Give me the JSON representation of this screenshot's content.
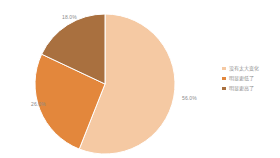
{
  "chart_data": {
    "type": "pie",
    "title": "",
    "subtitle": "",
    "xlabel": "",
    "ylabel": "",
    "grid": false,
    "legend_position": "right",
    "start_angle_deg": 0,
    "direction": "clockwise",
    "categories": [
      "没有太大变化",
      "明显更低了",
      "明显更高了"
    ],
    "values": [
      56.0,
      26.0,
      18.0
    ],
    "labels": [
      "56.0%",
      "26.0%",
      "18.0%"
    ],
    "colors": [
      "#F5C9A3",
      "#E3873C",
      "#A9703F"
    ],
    "slices": [
      {
        "name": "没有太大变化",
        "value": 56.0,
        "label": "56.0%",
        "color": "#F5C9A3"
      },
      {
        "name": "明显更低了",
        "value": 26.0,
        "label": "26.0%",
        "color": "#E3873C"
      },
      {
        "name": "明显更高了",
        "value": 18.0,
        "label": "18.0%",
        "color": "#A9703F"
      }
    ]
  },
  "legend": {
    "items": [
      {
        "label": "没有太大变化",
        "color": "#F5C9A3"
      },
      {
        "label": "明显更低了",
        "color": "#E3873C"
      },
      {
        "label": "明显更高了",
        "color": "#A9703F"
      }
    ]
  },
  "colors": {
    "background": "#FFFFFF",
    "label_text": "#8A8A8A",
    "legend_text": "#8F8F8F"
  }
}
